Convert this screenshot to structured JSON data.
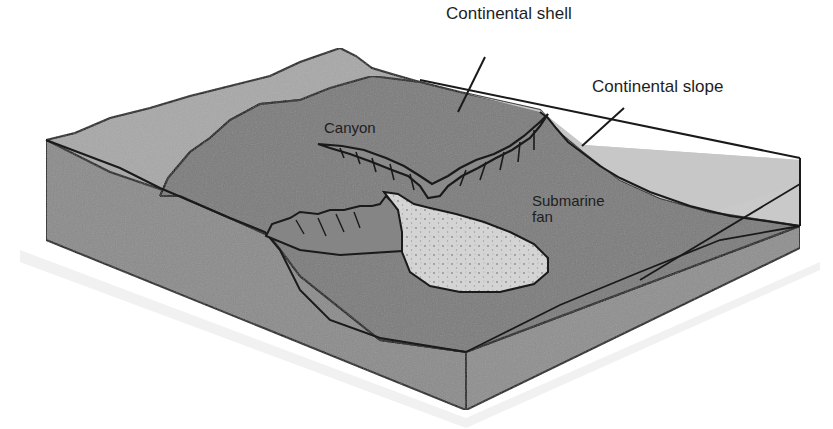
{
  "diagram": {
    "type": "block-diagram",
    "labels": {
      "continental_shelf": "Continental shell",
      "continental_slope": "Continental slope",
      "canyon": "Canyon",
      "submarine_fan_line1": "Submarine",
      "submarine_fan_line2": "fan"
    },
    "colors": {
      "background": "#ffffff",
      "land": "#a9a9a9",
      "shelf_seafloor": "#7e7e7e",
      "deep_seafloor": "#757575",
      "water_surface": "#c8c8c8",
      "front_face": "#8a8a8a",
      "right_face": "#9a9a9a",
      "fan": "#d6d6d6",
      "outline": "#1a1a1a"
    }
  }
}
